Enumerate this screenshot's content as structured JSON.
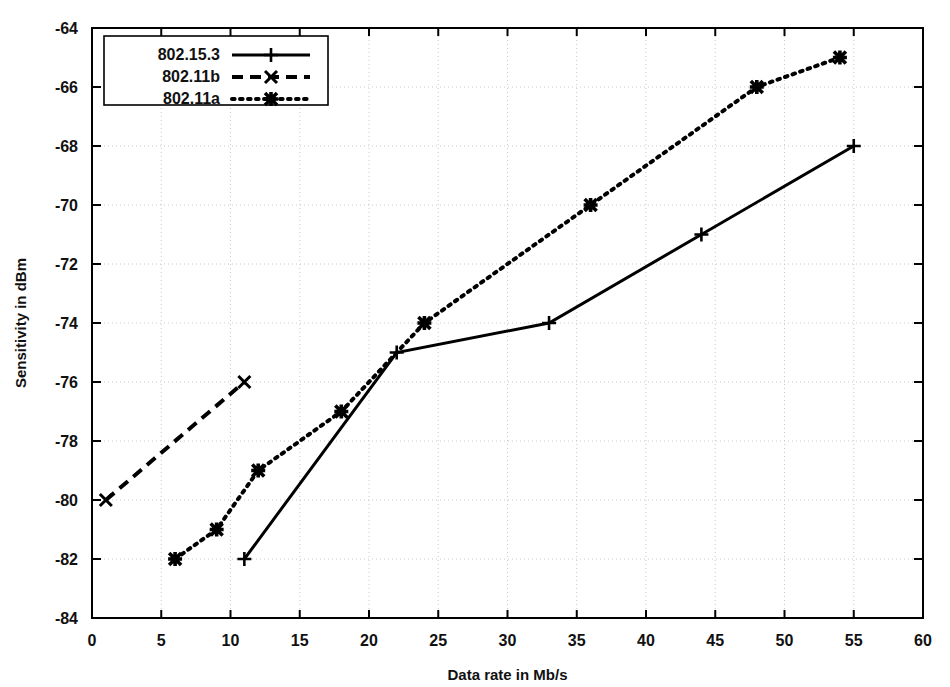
{
  "chart_data": {
    "type": "line",
    "title": "",
    "xlabel": "Data rate in Mb/s",
    "ylabel": "Sensitivity in dBm",
    "xlim": [
      0,
      60
    ],
    "ylim": [
      -84,
      -64
    ],
    "xticks": [
      0,
      5,
      10,
      15,
      20,
      25,
      30,
      35,
      40,
      45,
      50,
      55,
      60
    ],
    "yticks": [
      -84,
      -82,
      -80,
      -78,
      -76,
      -74,
      -72,
      -70,
      -68,
      -66,
      -64
    ],
    "xtick_labels": [
      "0",
      "5",
      "10",
      "15",
      "20",
      "25",
      "30",
      "35",
      "40",
      "45",
      "50",
      "55",
      "60"
    ],
    "ytick_labels": [
      "-84",
      "-82",
      "-80",
      "-78",
      "-76",
      "-74",
      "-72",
      "-70",
      "-68",
      "-66",
      "-64"
    ],
    "grid": true,
    "legend_position": "top-left",
    "series": [
      {
        "name": "802.15.3",
        "linestyle": "solid",
        "marker": "plus",
        "color": "#000000",
        "points": [
          {
            "x": 11,
            "y": -82
          },
          {
            "x": 22,
            "y": -75
          },
          {
            "x": 33,
            "y": -74
          },
          {
            "x": 44,
            "y": -71
          },
          {
            "x": 55,
            "y": -68
          }
        ]
      },
      {
        "name": "802.11b",
        "linestyle": "dashed",
        "marker": "cross",
        "color": "#000000",
        "points": [
          {
            "x": 1,
            "y": -80
          },
          {
            "x": 11,
            "y": -76
          }
        ]
      },
      {
        "name": "802.11a",
        "linestyle": "dotted",
        "marker": "star",
        "color": "#000000",
        "points": [
          {
            "x": 6,
            "y": -82
          },
          {
            "x": 9,
            "y": -81
          },
          {
            "x": 12,
            "y": -79
          },
          {
            "x": 18,
            "y": -77
          },
          {
            "x": 24,
            "y": -74
          },
          {
            "x": 36,
            "y": -70
          },
          {
            "x": 48,
            "y": -66
          },
          {
            "x": 54,
            "y": -65
          }
        ]
      }
    ]
  },
  "legend": {
    "entries": [
      {
        "label": "802.15.3"
      },
      {
        "label": "802.11b"
      },
      {
        "label": "802.11a"
      }
    ]
  },
  "colors": {
    "axis": "#000000",
    "grid": "#c8c8c8",
    "plot_background": "#ffffff"
  }
}
